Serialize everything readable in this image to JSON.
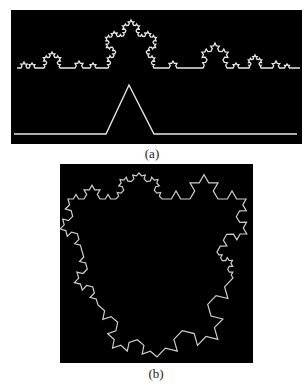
{
  "figure": {
    "panel_a": {
      "label": "(a)",
      "background": "#000000",
      "stroke": "#e8e8e8",
      "upper_curve": {
        "description": "Koch-like fractal profile curve",
        "baseline_y": 68,
        "x_start": 17,
        "x_end": 300,
        "bumps": [
          {
            "center_x": 24,
            "height": 6,
            "width": 6
          },
          {
            "center_x": 32,
            "height": 5,
            "width": 6
          },
          {
            "center_x": 52,
            "height": 16,
            "width": 16
          },
          {
            "center_x": 79,
            "height": 7,
            "width": 8
          },
          {
            "center_x": 93,
            "height": 5,
            "width": 6
          },
          {
            "center_x": 131,
            "height": 48,
            "width": 46
          },
          {
            "center_x": 173,
            "height": 7,
            "width": 8
          },
          {
            "center_x": 215,
            "height": 25,
            "width": 24
          },
          {
            "center_x": 236,
            "height": 5,
            "width": 6
          },
          {
            "center_x": 255,
            "height": 13,
            "width": 12
          },
          {
            "center_x": 276,
            "height": 7,
            "width": 7
          },
          {
            "center_x": 287,
            "height": 4,
            "width": 5
          }
        ]
      },
      "lower_curve": {
        "description": "Single triangular generator bump",
        "baseline_y": 134,
        "x_start": 14,
        "x_end": 297,
        "bump_left_x": 106,
        "peak_x": 129,
        "peak_y": 85,
        "bump_right_x": 154
      }
    },
    "panel_b": {
      "label": "(b)",
      "background": "#000000",
      "stroke": "#cfcfcf",
      "shape": "Koch snowflake (star outline)",
      "vertices": [
        [
          139,
          173
        ],
        [
          162,
          199
        ],
        [
          246,
          199
        ],
        [
          217,
          252
        ],
        [
          233,
          278
        ],
        [
          157,
          357
        ],
        [
          98,
          305
        ],
        [
          82,
          251
        ],
        [
          68,
          199
        ],
        [
          116,
          199
        ]
      ]
    }
  }
}
